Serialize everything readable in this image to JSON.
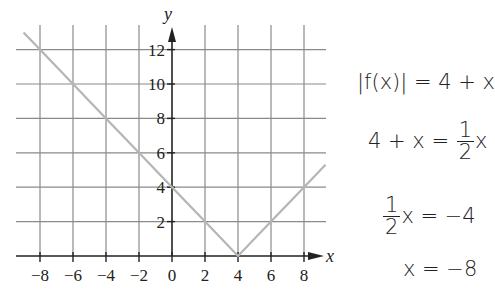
{
  "chart_data": {
    "type": "line",
    "title": "",
    "xlabel": "x",
    "ylabel": "y",
    "xlim": [
      -9,
      9.5
    ],
    "ylim": [
      0,
      13.5
    ],
    "grid": true,
    "x_ticks": [
      -8,
      -6,
      -4,
      -2,
      0,
      2,
      4,
      6,
      8
    ],
    "x_tick_labels": [
      "−8",
      "−6",
      "−4",
      "−2",
      "0",
      "2",
      "4",
      "6",
      "8"
    ],
    "y_ticks": [
      2,
      4,
      6,
      8,
      10,
      12
    ],
    "y_tick_labels": [
      "2",
      "4",
      "6",
      "8",
      "10",
      "12"
    ],
    "series": [
      {
        "name": "y = |x − 4|",
        "color": "#b5b5b5",
        "x": [
          -9,
          -8,
          -6,
          -4,
          -2,
          0,
          2,
          4,
          6,
          8,
          9.3
        ],
        "y": [
          13,
          12,
          10,
          8,
          6,
          4,
          2,
          0,
          2,
          4,
          5.3
        ]
      }
    ]
  },
  "graph": {
    "x_axis_label": "x",
    "y_axis_label": "y",
    "colors": {
      "grid": "#8a8a8a",
      "axis": "#222222",
      "line": "#b5b5b5"
    }
  },
  "equations": {
    "line1": "|f(x)| = 4 + x",
    "line2_left": "4 + x =",
    "line2_frac_num": "1",
    "line2_frac_den": "2",
    "line2_right": "x",
    "line3_frac_num": "1",
    "line3_frac_den": "2",
    "line3_right": "x = −4",
    "line4": "x = −8"
  }
}
